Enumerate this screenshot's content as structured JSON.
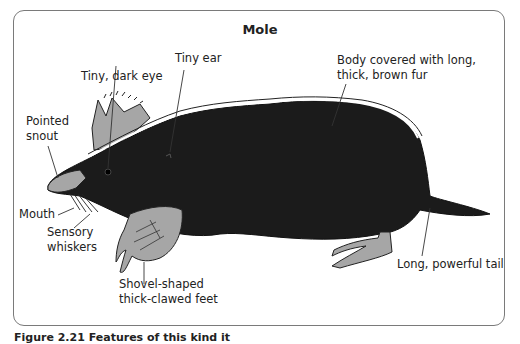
{
  "figure": {
    "title": "Mole",
    "caption": "Figure 2.21  Features of this kind it",
    "colors": {
      "body_fur": "#1b1b1b",
      "skin_gray": "#a6a6a6",
      "frame_border": "#7a7a7a",
      "leader_line": "#333333"
    },
    "labels": {
      "tiny_dark_eye": "Tiny, dark eye",
      "tiny_ear": "Tiny ear",
      "body_fur_line1": "Body covered with long,",
      "body_fur_line2": "thick, brown fur",
      "pointed_snout_line1": "Pointed",
      "pointed_snout_line2": "snout",
      "mouth": "Mouth",
      "sensory_whiskers_line1": "Sensory",
      "sensory_whiskers_line2": "whiskers",
      "shovel_feet_line1": "Shovel-shaped",
      "shovel_feet_line2": "thick-clawed feet",
      "tail": "Long, powerful tail"
    }
  }
}
